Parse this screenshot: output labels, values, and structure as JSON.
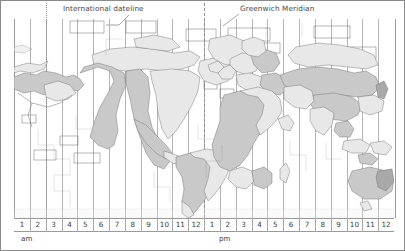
{
  "figure": {
    "title_visible": false,
    "width": 405,
    "height": 251
  },
  "annotations": {
    "dateline_label": "International dateline",
    "meridian_label": "Greenwich Meridian"
  },
  "axis": {
    "am_label": "am",
    "pm_label": "pm",
    "hours": [
      "1",
      "2",
      "3",
      "4",
      "5",
      "6",
      "7",
      "8",
      "9",
      "10",
      "11",
      "12",
      "1",
      "2",
      "3",
      "4",
      "5",
      "6",
      "7",
      "8",
      "9",
      "10",
      "11",
      "12"
    ],
    "zone_count": 24
  },
  "chart_data": {
    "type": "map",
    "xlabel": "",
    "ylabel": "",
    "categories": [
      "1 am",
      "2 am",
      "3 am",
      "4 am",
      "5 am",
      "6 am",
      "7 am",
      "8 am",
      "9 am",
      "10 am",
      "11 am",
      "12 noon",
      "1 pm",
      "2 pm",
      "3 pm",
      "4 pm",
      "5 pm",
      "6 pm",
      "7 pm",
      "8 pm",
      "9 pm",
      "10 pm",
      "11 pm",
      "12 midnight"
    ],
    "grid": true,
    "legend": false,
    "annotations": [
      {
        "text": "International dateline",
        "x_zone": 2,
        "style": "dotted"
      },
      {
        "text": "Greenwich Meridian",
        "x_zone": 13,
        "style": "dashed"
      }
    ],
    "series": [
      {
        "name": "time zone columns",
        "values": [
          1,
          2,
          3,
          4,
          5,
          6,
          7,
          8,
          9,
          10,
          11,
          12,
          13,
          14,
          15,
          16,
          17,
          18,
          19,
          20,
          21,
          22,
          23,
          24
        ]
      }
    ],
    "shading": {
      "alternating": true,
      "light": "#e8e8e8",
      "mid": "#c9c9c9",
      "dark": "#a9a9a9"
    }
  },
  "colors": {
    "border": "#8a8a8a",
    "gridline": "#b4b4b4",
    "land_outline": "#6f6f6f",
    "text": "#3d3d3d",
    "label_text": "#4a4a4a"
  }
}
